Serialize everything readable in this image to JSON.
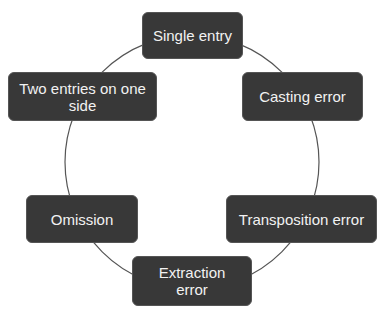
{
  "diagram": {
    "type": "cycle",
    "colors": {
      "node_fill": "#383838",
      "node_text": "#f2f2f2",
      "connector": "#555555",
      "background": "#ffffff"
    },
    "nodes": [
      {
        "id": "single-entry",
        "label": "Single entry"
      },
      {
        "id": "casting-error",
        "label": "Casting error"
      },
      {
        "id": "transposition-error",
        "label": "Transposition error"
      },
      {
        "id": "extraction-error",
        "label": "Extraction error"
      },
      {
        "id": "omission",
        "label": "Omission"
      },
      {
        "id": "two-entries",
        "label": "Two entries on one side"
      }
    ]
  }
}
